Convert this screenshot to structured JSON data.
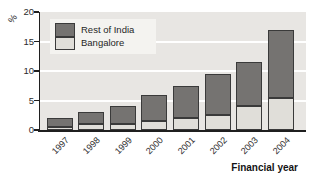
{
  "colors": {
    "rest_of_india": "#757371",
    "bangalore": "#e0ded9",
    "plot_background": "#e8e6e3",
    "gridline": "#ffffff",
    "axis": "#1f1f1f",
    "legend_background": "#f4f3f0"
  },
  "legend": {
    "items": [
      {
        "label": "Rest of India",
        "color": "#757371"
      },
      {
        "label": "Bangalore",
        "color": "#e0ded9"
      }
    ]
  },
  "chart_data": {
    "type": "bar",
    "stacked": true,
    "title": "",
    "ylabel": "%",
    "xlabel": "Financial year",
    "categories": [
      "1997",
      "1998",
      "1999",
      "2000",
      "2001",
      "2002",
      "2003",
      "2004"
    ],
    "series": [
      {
        "name": "Bangalore",
        "color": "#e0ded9",
        "values": [
          0.5,
          1,
          1,
          1.5,
          2,
          2.5,
          4,
          5.5
        ]
      },
      {
        "name": "Rest of India",
        "color": "#757371",
        "values": [
          1.5,
          2,
          3,
          4.5,
          5.5,
          7,
          7.5,
          11.5
        ]
      }
    ],
    "totals": [
      2,
      3,
      4,
      6,
      7.5,
      9.5,
      11.5,
      17
    ],
    "ylim": [
      0,
      20
    ],
    "yticks": [
      0,
      5,
      10,
      15,
      20
    ],
    "grid": true,
    "legend_position": "upper left"
  }
}
